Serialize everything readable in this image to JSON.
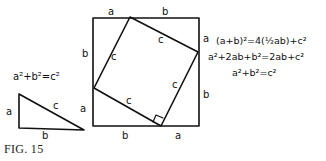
{
  "figure": {
    "caption": "FIG. 15",
    "small_triangle": {
      "formula": "a²+b²=c²",
      "labels": {
        "vertical": "a",
        "base": "b",
        "hypotenuse": "c"
      }
    },
    "big_square": {
      "outer_labels": {
        "top_left": "a",
        "top_right": "b",
        "left_upper": "b",
        "left_lower": "a",
        "bottom_left": "b",
        "bottom_right": "a",
        "right_upper": "a",
        "right_lower": "b"
      },
      "inner_square_labels": {
        "top": "c",
        "left": "c",
        "right": "c",
        "bottom": "c"
      }
    },
    "equations": [
      "(a+b)²=4(½ab)+c²",
      "a²+2ab+b²=2ab+c²",
      "a²+b²=c²"
    ]
  }
}
